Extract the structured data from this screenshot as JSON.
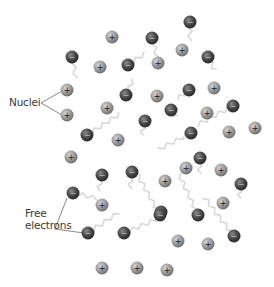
{
  "labels": {
    "nuclei": "Nuclei",
    "free_electrons_line1": "Free",
    "free_electrons_line2": "electrons"
  },
  "colors": {
    "nucleus_fill": "#9a9a9a",
    "nucleus_edge": "#6e6e6e",
    "electron_fill": "#4a4a4a",
    "electron_edge": "#2a2a2a",
    "path": "#d8d8d8",
    "leader": "#555555"
  },
  "symbols": {
    "nucleus": "+",
    "electron": "−"
  },
  "nuclei": [
    [
      112,
      37
    ],
    [
      100,
      67
    ],
    [
      67,
      90
    ],
    [
      107,
      108
    ],
    [
      67,
      115
    ],
    [
      118,
      140
    ],
    [
      182,
      50
    ],
    [
      158,
      63
    ],
    [
      157,
      96
    ],
    [
      214,
      88
    ],
    [
      207,
      113
    ],
    [
      229,
      132
    ],
    [
      255,
      128
    ],
    [
      71,
      157
    ],
    [
      102,
      205
    ],
    [
      186,
      168
    ],
    [
      221,
      170
    ],
    [
      165,
      181
    ],
    [
      223,
      203
    ],
    [
      178,
      241
    ],
    [
      208,
      244
    ],
    [
      102,
      268
    ],
    [
      137,
      268
    ],
    [
      167,
      270
    ]
  ],
  "electrons": [
    [
      72,
      57
    ],
    [
      128,
      65
    ],
    [
      126,
      95
    ],
    [
      87,
      135
    ],
    [
      190,
      22
    ],
    [
      152,
      38
    ],
    [
      208,
      57
    ],
    [
      189,
      90
    ],
    [
      171,
      110
    ],
    [
      233,
      106
    ],
    [
      145,
      121
    ],
    [
      191,
      133
    ],
    [
      102,
      175
    ],
    [
      132,
      172
    ],
    [
      73,
      193
    ],
    [
      88,
      233
    ],
    [
      124,
      233
    ],
    [
      161,
      212
    ],
    [
      200,
      158
    ],
    [
      241,
      184
    ],
    [
      160,
      215
    ],
    [
      198,
      215
    ],
    [
      234,
      236
    ]
  ],
  "leaders": {
    "nuclei": [
      [
        41,
        103
      ],
      [
        62,
        91
      ],
      [
        62,
        115
      ]
    ],
    "free_electrons": [
      [
        67,
        198
      ],
      [
        55,
        229
      ],
      [
        84,
        233
      ]
    ]
  }
}
